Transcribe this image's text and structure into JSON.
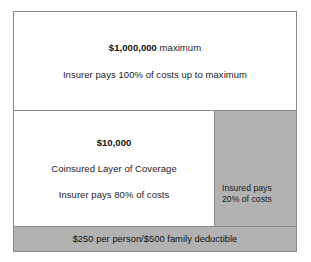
{
  "diagram": {
    "type": "stacked-layer-diagram",
    "colors": {
      "border": "#8a8a8a",
      "layer_fill_covered": "#ffffff",
      "layer_fill_insured_share": "#b2b2b2",
      "text": "#1c1c1c"
    },
    "layers": {
      "maximum": {
        "amount": "$1,000,000",
        "amount_suffix": " maximum",
        "amount_full": "$1,000,000 maximum",
        "detail": "Insurer pays 100% of costs up to maximum"
      },
      "coinsured": {
        "amount": "$10,000",
        "name": "Coinsured Layer of Coverage",
        "detail": "Insurer pays 80% of costs"
      },
      "insured_share": {
        "line1": "Insured pays",
        "line2": "20% of costs"
      },
      "deductible": {
        "text": "$250 per person/$500 family deductible"
      }
    }
  },
  "chart_data": {
    "type": "table",
    "categories": [
      "Maximum benefit layer",
      "Coinsured layer (insurer share)",
      "Coinsured layer (insured share)",
      "Deductible"
    ],
    "series": [
      {
        "name": "Insurer pays (%)",
        "values": [
          100,
          80,
          0,
          0
        ]
      },
      {
        "name": "Insured pays (%)",
        "values": [
          0,
          20,
          20,
          100
        ]
      }
    ],
    "annotations": [
      "$1,000,000 maximum",
      "Insurer pays 100% of costs up to maximum",
      "$10,000",
      "Coinsured Layer of Coverage",
      "Insurer pays 80% of costs",
      "Insured pays 20% of costs",
      "$250 per person/$500 family deductible"
    ],
    "thresholds": [
      {
        "label": "Deductible per person",
        "value": 250
      },
      {
        "label": "Deductible per family",
        "value": 500
      },
      {
        "label": "Coinsured layer",
        "value": 10000
      },
      {
        "label": "Maximum benefit",
        "value": 1000000
      }
    ],
    "xlabel": "",
    "ylabel": "",
    "grid": false,
    "legend": "none"
  }
}
